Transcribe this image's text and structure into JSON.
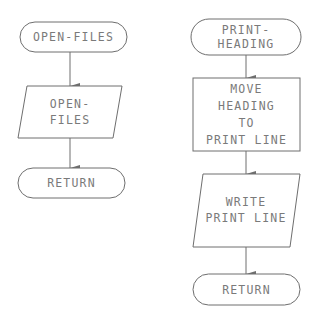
{
  "flowcharts": [
    {
      "name": "open-files",
      "nodes": [
        {
          "id": "open-files-start",
          "type": "terminal",
          "lines": [
            "OPEN-FILES"
          ]
        },
        {
          "id": "open-files-io",
          "type": "input-output",
          "lines": [
            "OPEN-",
            "FILES"
          ]
        },
        {
          "id": "open-files-return",
          "type": "terminal",
          "lines": [
            "RETURN"
          ]
        }
      ],
      "edges": [
        [
          "open-files-start",
          "open-files-io"
        ],
        [
          "open-files-io",
          "open-files-return"
        ]
      ]
    },
    {
      "name": "print-heading",
      "nodes": [
        {
          "id": "print-heading-start",
          "type": "terminal",
          "lines": [
            "PRINT-",
            "HEADING"
          ]
        },
        {
          "id": "move-heading-process",
          "type": "process",
          "lines": [
            "MOVE",
            "HEADING",
            "TO",
            "PRINT LINE"
          ]
        },
        {
          "id": "write-print-line-io",
          "type": "input-output",
          "lines": [
            "WRITE",
            "PRINT LINE"
          ]
        },
        {
          "id": "print-heading-return",
          "type": "terminal",
          "lines": [
            "RETURN"
          ]
        }
      ],
      "edges": [
        [
          "print-heading-start",
          "move-heading-process"
        ],
        [
          "move-heading-process",
          "write-print-line-io"
        ],
        [
          "write-print-line-io",
          "print-heading-return"
        ]
      ]
    }
  ]
}
